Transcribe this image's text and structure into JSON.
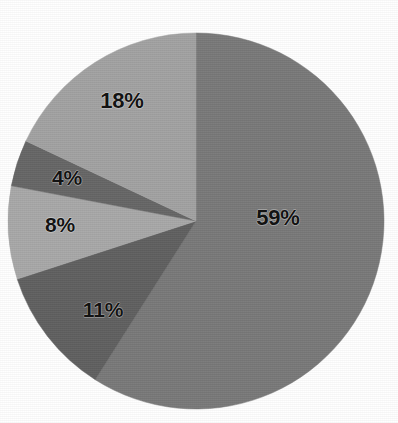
{
  "chart_data": {
    "type": "pie",
    "title": "",
    "subtitle": "",
    "xlabel": "",
    "ylabel": "",
    "legend": "none",
    "grid": false,
    "start_angle_deg": 0,
    "direction": "clockwise",
    "center": {
      "cx": 196,
      "cy": 221,
      "r": 188
    },
    "categories": [
      "59%",
      "11%",
      "8%",
      "4%",
      "18%"
    ],
    "values": [
      59,
      11,
      8,
      4,
      18
    ],
    "labels": [
      "59%",
      "11%",
      "8%",
      "4%",
      "18%"
    ],
    "colors": [
      "#797979",
      "#606060",
      "#a8a8a8",
      "#666666",
      "#a2a2a2"
    ],
    "slices": [
      {
        "label": "59%",
        "value": 59,
        "color": "#797979",
        "start_deg": 0,
        "end_deg": 212.4,
        "label_x": 278,
        "label_y": 218,
        "label_size": 22
      },
      {
        "label": "11%",
        "value": 11,
        "color": "#606060",
        "start_deg": 212.4,
        "end_deg": 252.0,
        "label_x": 103,
        "label_y": 310,
        "label_size": 21
      },
      {
        "label": "8%",
        "value": 8,
        "color": "#a8a8a8",
        "start_deg": 252.0,
        "end_deg": 280.8,
        "label_x": 60,
        "label_y": 225,
        "label_size": 21
      },
      {
        "label": "4%",
        "value": 4,
        "color": "#666666",
        "start_deg": 280.8,
        "end_deg": 295.2,
        "label_x": 67,
        "label_y": 178,
        "label_size": 21
      },
      {
        "label": "18%",
        "value": 18,
        "color": "#a2a2a2",
        "start_deg": 295.2,
        "end_deg": 360.0,
        "label_x": 122,
        "label_y": 101,
        "label_size": 22
      }
    ]
  }
}
